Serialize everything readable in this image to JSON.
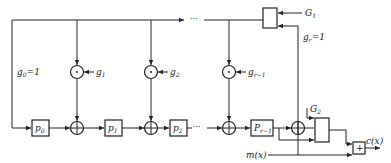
{
  "diagram": {
    "type": "cyclic-code-encoder",
    "registers": [
      {
        "base": "p",
        "sub": "0"
      },
      {
        "base": "p",
        "sub": "1"
      },
      {
        "base": "p",
        "sub": "2"
      },
      {
        "base": "P",
        "sub": "r−1"
      }
    ],
    "coefficients": [
      {
        "base": "g",
        "sub": "1"
      },
      {
        "base": "g",
        "sub": "2"
      },
      {
        "base": "g",
        "sub": "r−1"
      }
    ],
    "g0_label": {
      "base": "g",
      "sub": "0",
      "rest": "=1"
    },
    "gr_label": {
      "base": "g",
      "sub": "r",
      "rest": "=1"
    },
    "gate1_label": {
      "base": "G",
      "sub": "1"
    },
    "gate2_label": {
      "base": "G",
      "sub": "2"
    },
    "input_label": "m(x)",
    "output_label": "c(x)",
    "adder_symbol": "+",
    "ellipsis": "···",
    "colors": {
      "stroke": "#222222",
      "background": "#ffffff"
    }
  }
}
